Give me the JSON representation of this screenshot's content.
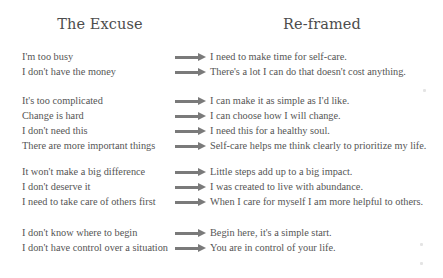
{
  "headings": {
    "left": "The Excuse",
    "right": "Re-framed"
  },
  "arrow_color": "#7a7a7a",
  "groups": [
    {
      "rows": [
        {
          "excuse": "I'm too busy",
          "reframe": "I need to make time for self-care."
        },
        {
          "excuse": "I don't have the money",
          "reframe": "There's a lot I can do that doesn't cost anything."
        }
      ]
    },
    {
      "rows": [
        {
          "excuse": "It's too complicated",
          "reframe": "I can make it as simple as I'd like."
        },
        {
          "excuse": "Change is hard",
          "reframe": "I can choose how I will change."
        },
        {
          "excuse": "I don't need this",
          "reframe": "I need this for a healthy soul."
        },
        {
          "excuse": "There are more important things",
          "reframe": "Self-care helps me think clearly to prioritize my life."
        }
      ]
    },
    {
      "rows": [
        {
          "excuse": "It won't make a big difference",
          "reframe": "Little steps add up to a big impact."
        },
        {
          "excuse": "I don't deserve it",
          "reframe": "I was created to live with abundance."
        },
        {
          "excuse": "I need to take care of others first",
          "reframe": "When I care for myself I am more helpful to others."
        }
      ]
    },
    {
      "rows": [
        {
          "excuse": "I don't know where to begin",
          "reframe": "Begin here, it's a simple start."
        },
        {
          "excuse": "I don't have control over a situation",
          "reframe": "You are in control of your life."
        }
      ]
    }
  ]
}
